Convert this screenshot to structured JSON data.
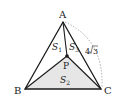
{
  "diagram": {
    "type": "triangle-with-interior-point",
    "colors": {
      "stroke": "#1a1a1a",
      "shade": "#e6e6e6",
      "arc": "#999999"
    },
    "vertices": {
      "A": {
        "label": "A",
        "x": 63,
        "y": 22
      },
      "B": {
        "label": "B",
        "x": 25,
        "y": 89
      },
      "C": {
        "label": "C",
        "x": 101,
        "y": 89
      },
      "P": {
        "label": "P",
        "x": 67,
        "y": 56
      }
    },
    "regions": {
      "S1": {
        "base": "S",
        "sub": "1"
      },
      "S2": {
        "base": "S",
        "sub": "2"
      },
      "S3": {
        "base": "S",
        "sub": "3"
      }
    },
    "length_label": {
      "coef": "4",
      "radicand": "3"
    }
  }
}
